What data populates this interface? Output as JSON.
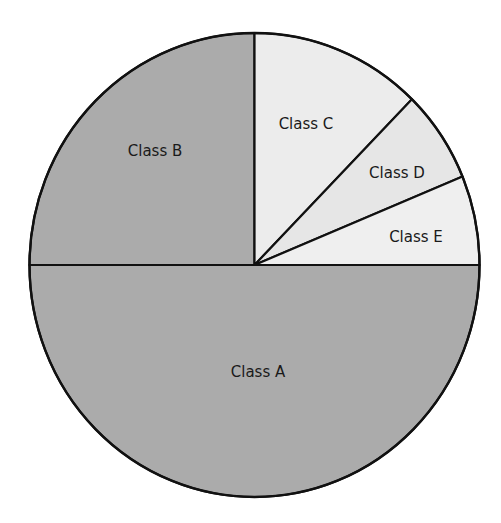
{
  "chart_data": {
    "type": "pie",
    "title": "",
    "start_angle_deg": 0,
    "direction": "counterclockwise",
    "categories": [
      "Class A",
      "Class B",
      "Class C",
      "Class D",
      "Class E"
    ],
    "values": [
      50,
      25,
      12.3,
      6.4,
      6.2
    ],
    "unit": "percent (estimated from angles)",
    "slices": [
      {
        "label": "Class A",
        "value": 50,
        "start_deg": 180,
        "end_deg": 360,
        "color": "#ababab"
      },
      {
        "label": "Class B",
        "value": 25,
        "start_deg": 90,
        "end_deg": 180,
        "color": "#ababab"
      },
      {
        "label": "Class C",
        "value": 12.3,
        "start_deg": 45.6,
        "end_deg": 90,
        "color": "#ececec"
      },
      {
        "label": "Class D",
        "value": 6.4,
        "start_deg": 22.4,
        "end_deg": 45.6,
        "color": "#e6e6e6"
      },
      {
        "label": "Class E",
        "value": 6.2,
        "start_deg": 0,
        "end_deg": 22.4,
        "color": "#efefef"
      }
    ],
    "legend": "none (labels inside slices)",
    "outline_color": "#111111"
  },
  "labels": {
    "a": "Class A",
    "b": "Class B",
    "c": "Class C",
    "d": "Class D",
    "e": "Class E"
  }
}
